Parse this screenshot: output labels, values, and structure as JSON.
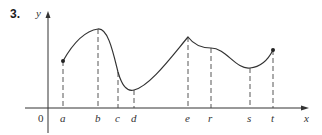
{
  "problem_number": "3.",
  "axes": {
    "x_label": "x",
    "y_label": "y",
    "origin_label": "0"
  },
  "colors": {
    "curve": "#333333",
    "axis": "#333333",
    "dashed": "#444444"
  },
  "points": [
    {
      "label": "a",
      "x": 63,
      "y": 61,
      "type": "endpoint-closed"
    },
    {
      "label": "b",
      "x": 98,
      "y": 29,
      "type": "local-max"
    },
    {
      "label": "c",
      "x": 118,
      "y": 72,
      "type": "inflection"
    },
    {
      "label": "d",
      "x": 134,
      "y": 90,
      "type": "local-min"
    },
    {
      "label": "e",
      "x": 188,
      "y": 37,
      "type": "corner-max"
    },
    {
      "label": "r",
      "x": 211,
      "y": 48,
      "type": "inflection"
    },
    {
      "label": "s",
      "x": 250,
      "y": 68,
      "type": "local-min"
    },
    {
      "label": "t",
      "x": 273,
      "y": 50,
      "type": "endpoint-closed"
    }
  ]
}
